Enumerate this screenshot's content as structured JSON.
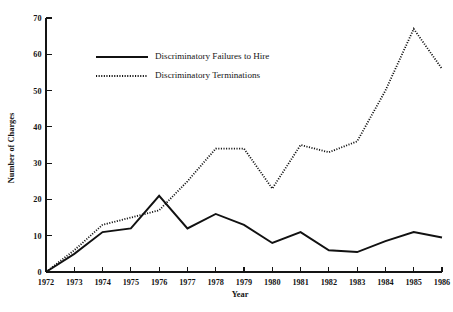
{
  "chart_data": {
    "type": "line",
    "title": "",
    "subtitle": "",
    "xlabel": "Year",
    "ylabel": "Number of Charges",
    "grid": false,
    "legend_position": "inside-top-left",
    "xlim": [
      1972,
      1986
    ],
    "ylim": [
      0,
      70
    ],
    "ytick_step": 10,
    "categories": [
      "1972",
      "1973",
      "1974",
      "1975",
      "1976",
      "1977",
      "1978",
      "1979",
      "1980",
      "1981",
      "1982",
      "1983",
      "1984",
      "1985",
      "1986"
    ],
    "x": [
      1972,
      1973,
      1974,
      1975,
      1976,
      1977,
      1978,
      1979,
      1980,
      1981,
      1982,
      1983,
      1984,
      1985,
      1986
    ],
    "xtick_labels": [
      "1972",
      "1973",
      "1974",
      "1975",
      "1976",
      "1977",
      "1978",
      "1979",
      "1980",
      "1981",
      "1982",
      "1983",
      "1984",
      "1985",
      "1986"
    ],
    "ytick_labels": [
      "0",
      "10",
      "20",
      "30",
      "40",
      "50",
      "60",
      "70"
    ],
    "ytick_values": [
      0,
      10,
      20,
      30,
      40,
      50,
      60,
      70
    ],
    "series": [
      {
        "name": "Discriminatory Failures to Hire",
        "style": "solid",
        "color": "#111111",
        "values": [
          0,
          5,
          11,
          12,
          21,
          12,
          16,
          13,
          8,
          11,
          6,
          5.5,
          8.5,
          11,
          9.5
        ]
      },
      {
        "name": "Discriminatory Terminations",
        "style": "dotted",
        "color": "#111111",
        "values": [
          0,
          6,
          13,
          15,
          17,
          25,
          34,
          34,
          23,
          35,
          33,
          36,
          50,
          67,
          56
        ]
      }
    ],
    "legend": [
      {
        "label": "Discriminatory Failures to Hire",
        "style": "solid"
      },
      {
        "label": "Discriminatory Terminations",
        "style": "dotted"
      }
    ],
    "annotations": []
  }
}
